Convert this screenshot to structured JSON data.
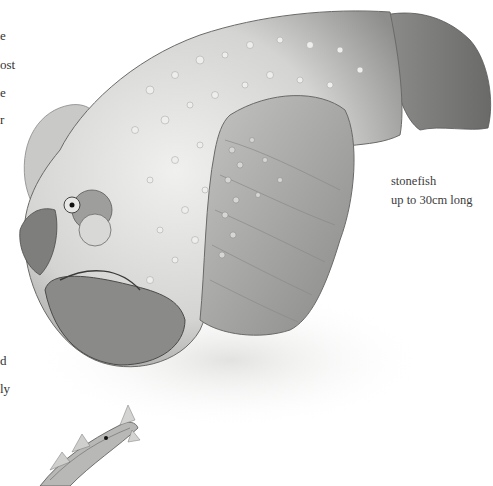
{
  "left_column_fragments": [
    {
      "text": "e",
      "top": 28
    },
    {
      "text": "ost",
      "top": 57
    },
    {
      "text": "e",
      "top": 85
    },
    {
      "text": "r",
      "top": 112
    },
    {
      "text": "d",
      "top": 353
    },
    {
      "text": "ly",
      "top": 381
    }
  ],
  "illustration": {
    "subject": "stonefish",
    "secondary_subject": "small striped fish"
  },
  "caption": {
    "name": "stonefish",
    "size": "up to 30cm long"
  },
  "colors": {
    "background": "#ffffff",
    "text": "#3a3a3a",
    "fish_body": "#d8d8d6",
    "fish_dark": "#6f6f6d",
    "fin": "#a8a8a6"
  }
}
